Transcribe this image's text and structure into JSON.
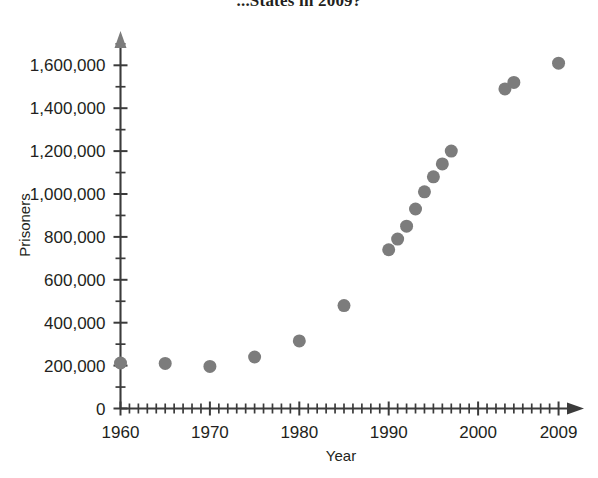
{
  "title": {
    "text": "...States in 2009?",
    "note": "cropped-at-top"
  },
  "axes": {
    "x": {
      "label": "Year",
      "tick_labels": [
        "1960",
        "1970",
        "1980",
        "1990",
        "2000",
        "2009"
      ],
      "tick_values": [
        1960,
        1970,
        1980,
        1990,
        2000,
        2009
      ],
      "minor_tick_step": 1,
      "range": [
        1960,
        2010
      ],
      "arrow": true
    },
    "y": {
      "label": "Prisoners",
      "tick_labels": [
        "0",
        "200,000",
        "400,000",
        "600,000",
        "800,000",
        "1,000,000",
        "1,200,000",
        "1,400,000",
        "1,600,000"
      ],
      "tick_values": [
        0,
        200000,
        400000,
        600000,
        800000,
        1000000,
        1200000,
        1400000,
        1600000
      ],
      "minor_tick_step": 100000,
      "range": [
        0,
        1700000
      ],
      "arrow": true
    }
  },
  "style": {
    "point_color": "#7c7c7c",
    "axis_color": "#3b3b3b",
    "text_color": "#231f20",
    "background": "#ffffff",
    "point_radius": 6.5
  },
  "chart_data": {
    "type": "scatter",
    "title": "...States in 2009?",
    "xlabel": "Year",
    "ylabel": "Prisoners",
    "xlim": [
      1960,
      2010
    ],
    "ylim": [
      0,
      1700000
    ],
    "grid": false,
    "legend": null,
    "x": [
      1960,
      1965,
      1970,
      1975,
      1980,
      1985,
      1990,
      1991,
      1992,
      1993,
      1994,
      1995,
      1996,
      1997,
      2003,
      2004,
      2009
    ],
    "y": [
      212000,
      210000,
      196000,
      240000,
      315000,
      480000,
      740000,
      790000,
      850000,
      930000,
      1010000,
      1080000,
      1140000,
      1200000,
      1490000,
      1520000,
      1610000
    ],
    "points": [
      {
        "year": 1960,
        "prisoners": 212000
      },
      {
        "year": 1965,
        "prisoners": 210000
      },
      {
        "year": 1970,
        "prisoners": 196000
      },
      {
        "year": 1975,
        "prisoners": 240000
      },
      {
        "year": 1980,
        "prisoners": 315000
      },
      {
        "year": 1985,
        "prisoners": 480000
      },
      {
        "year": 1990,
        "prisoners": 740000
      },
      {
        "year": 1991,
        "prisoners": 790000
      },
      {
        "year": 1992,
        "prisoners": 850000
      },
      {
        "year": 1993,
        "prisoners": 930000
      },
      {
        "year": 1994,
        "prisoners": 1010000
      },
      {
        "year": 1995,
        "prisoners": 1080000
      },
      {
        "year": 1996,
        "prisoners": 1140000
      },
      {
        "year": 1997,
        "prisoners": 1200000
      },
      {
        "year": 2003,
        "prisoners": 1490000
      },
      {
        "year": 2004,
        "prisoners": 1520000
      },
      {
        "year": 2009,
        "prisoners": 1610000
      }
    ]
  }
}
